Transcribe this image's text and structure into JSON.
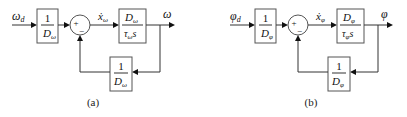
{
  "diagrams": [
    {
      "caption": "(a)",
      "input_label": "ω",
      "input_sub": "d",
      "prefilter": {
        "num": "1",
        "den": "D",
        "den_sub": "ω"
      },
      "sum": {
        "plus": "+",
        "minus": "−"
      },
      "signal_label": "ẋ",
      "signal_sub": "ω",
      "plant": {
        "num": "D",
        "num_sub": "ω",
        "den": "τ",
        "den_sub": "ω",
        "den_tail": "s"
      },
      "output_label": "ω",
      "feedback": {
        "num": "1",
        "den": "D",
        "den_sub": "ω"
      }
    },
    {
      "caption": "(b)",
      "input_label": "φ",
      "input_sub": "d",
      "prefilter": {
        "num": "1",
        "den": "D",
        "den_sub": "φ"
      },
      "sum": {
        "plus": "+",
        "minus": "−"
      },
      "signal_label": "ẋ",
      "signal_sub": "φ",
      "plant": {
        "num": "D",
        "num_sub": "φ",
        "den": "τ",
        "den_sub": "φ",
        "den_tail": "s"
      },
      "output_label": "φ",
      "feedback": {
        "num": "1",
        "den": "D",
        "den_sub": "φ"
      }
    }
  ]
}
